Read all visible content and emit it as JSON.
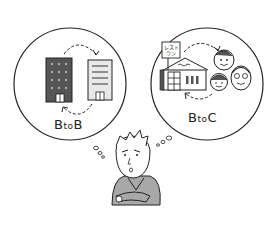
{
  "illustration": {
    "left_bubble": {
      "label_b1": "B",
      "label_to": "to",
      "label_b2": "B",
      "description": "Two company buildings exchanging"
    },
    "right_bubble": {
      "label_b": "B",
      "label_to": "to",
      "label_c": "C",
      "sign_line1": "レスト",
      "sign_line2": "ラン",
      "description": "Restaurant and customers exchanging"
    },
    "figure": "Thinking man with arms crossed",
    "colors": {
      "line": "#222222",
      "dark_building": "#555555",
      "light_fill": "#e8e8e8",
      "sweater": "#a8a8a8"
    }
  }
}
